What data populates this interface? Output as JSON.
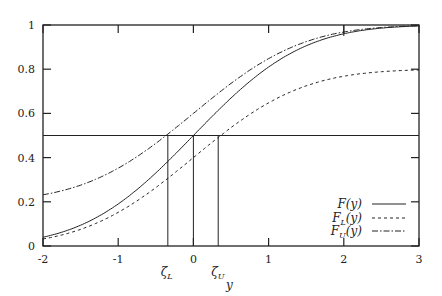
{
  "chart_data": {
    "type": "line",
    "title": "",
    "xlabel": "y",
    "ylabel": "",
    "xlim": [
      -2,
      3
    ],
    "ylim": [
      0,
      1
    ],
    "grid": false,
    "legend_position": "lower right",
    "x_ticks": [
      "-2",
      "-1",
      "0",
      "1",
      "2",
      "3"
    ],
    "y_ticks": [
      "0",
      "0.2",
      "0.4",
      "0.6",
      "0.8",
      "1"
    ],
    "annotations": [
      {
        "label": "ζL",
        "x": -0.34,
        "type": "vertical-line"
      },
      {
        "label": "0",
        "x": 0,
        "type": "vertical-line"
      },
      {
        "label": "ζU",
        "x": 0.33,
        "type": "vertical-line"
      },
      {
        "label": "",
        "y": 0.5,
        "type": "horizontal-line"
      },
      {
        "label": "",
        "x": 2,
        "type": "vertical-segment-near-top"
      }
    ],
    "x": [
      -2,
      -1.5,
      -1,
      -0.5,
      -0.34,
      0,
      0.33,
      0.5,
      1,
      1.5,
      2,
      2.5,
      3
    ],
    "series": [
      {
        "name": "F(y)",
        "style": "solid",
        "values": [
          0.04,
          0.09,
          0.19,
          0.33,
          0.38,
          0.5,
          0.61,
          0.67,
          0.81,
          0.91,
          0.96,
          0.986,
          0.996
        ]
      },
      {
        "name": "F_L(y)",
        "style": "dashed",
        "values": [
          0.03,
          0.07,
          0.15,
          0.26,
          0.31,
          0.4,
          0.49,
          0.53,
          0.65,
          0.73,
          0.77,
          0.79,
          0.8
        ]
      },
      {
        "name": "F_U(y)",
        "style": "dash-dot",
        "values": [
          0.23,
          0.27,
          0.35,
          0.46,
          0.5,
          0.6,
          0.69,
          0.73,
          0.85,
          0.93,
          0.97,
          0.99,
          1.0
        ]
      }
    ]
  },
  "legend": {
    "items": [
      {
        "main": "F",
        "sub": "",
        "arg": "(y)"
      },
      {
        "main": "F",
        "sub": "L",
        "arg": "(y)"
      },
      {
        "main": "F",
        "sub": "U",
        "arg": "(y)"
      }
    ]
  },
  "markers": {
    "zeta_l": "ζ",
    "zeta_l_sub": "L",
    "zeta_u": "ζ",
    "zeta_u_sub": "U"
  }
}
